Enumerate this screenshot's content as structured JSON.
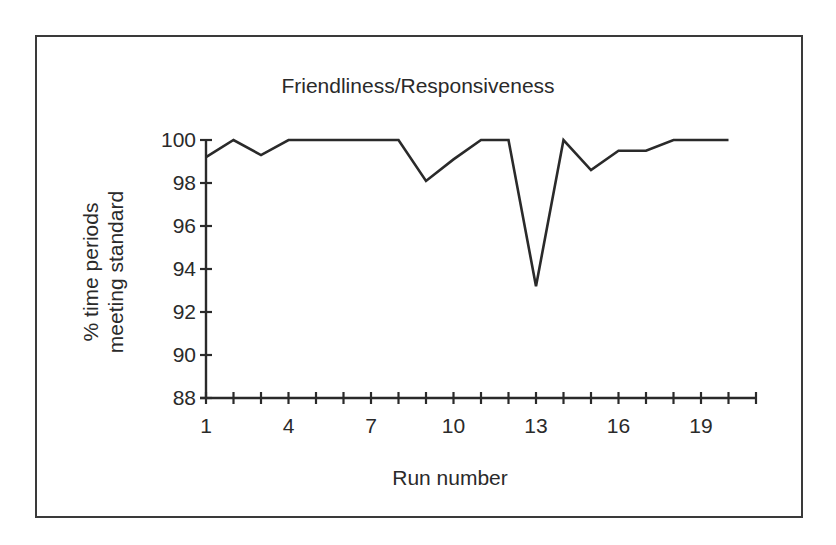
{
  "chart_data": {
    "type": "line",
    "title": "Friendliness/Responsiveness",
    "xlabel": "Run number",
    "ylabel_lines": [
      "% time periods",
      "meeting standard"
    ],
    "ylabel": "% time periods meeting standard",
    "x": [
      1,
      2,
      3,
      4,
      5,
      6,
      7,
      8,
      9,
      10,
      11,
      12,
      13,
      14,
      15,
      16,
      17,
      18,
      19,
      20
    ],
    "series": [
      {
        "name": "Friendliness/Responsiveness",
        "values": [
          99.2,
          100,
          99.3,
          100,
          100,
          100,
          100,
          100,
          98.1,
          99.1,
          100,
          100,
          93.2,
          100,
          98.6,
          99.5,
          99.5,
          100,
          100,
          100
        ]
      }
    ],
    "xlim": [
      1,
      21
    ],
    "ylim": [
      88,
      100
    ],
    "xticks": [
      1,
      2,
      3,
      4,
      5,
      6,
      7,
      8,
      9,
      10,
      11,
      12,
      13,
      14,
      15,
      16,
      17,
      18,
      19,
      20,
      21
    ],
    "xtick_labels": [
      "1",
      "4",
      "7",
      "10",
      "13",
      "16",
      "19"
    ],
    "xtick_label_positions": [
      1,
      4,
      7,
      10,
      13,
      16,
      19
    ],
    "yticks": [
      88,
      90,
      92,
      94,
      96,
      98,
      100
    ],
    "ytick_labels": [
      "88",
      "90",
      "92",
      "94",
      "96",
      "98",
      "100"
    ],
    "grid": false,
    "legend": null,
    "line_color": "#2a2a2a"
  }
}
